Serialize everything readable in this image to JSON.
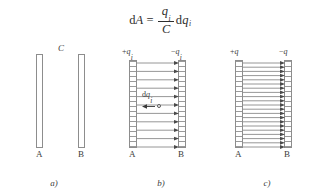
{
  "formula": {
    "lhs_d": "d",
    "lhs_var": "A",
    "equals": "=",
    "numerator_var": "q",
    "numerator_sub": "i",
    "denominator_var": "C",
    "rhs_d": "d",
    "rhs_var": "q",
    "rhs_sub": "i",
    "plain_text": "dA = (q_i / C) dq_i"
  },
  "colors": {
    "plate_border": "#8d8d8d",
    "field_line": "#7c7c7c",
    "arrow_head": "#4a4a4a",
    "text": "#3c3c3c",
    "background": "#ffffff"
  },
  "panels": [
    {
      "id": "a",
      "caption": "a)",
      "top_label": "C",
      "left_plate_label": "A",
      "right_plate_label": "B",
      "left_plate_charge": "",
      "right_plate_charge": "",
      "field_line_count": 0,
      "plates_hatched": false
    },
    {
      "id": "b",
      "caption": "b)",
      "top_label": "",
      "left_plate_label": "A",
      "right_plate_label": "B",
      "left_plate_charge_sign": "+",
      "left_plate_charge_var": "q",
      "left_plate_charge_sub": "i",
      "right_plate_charge_sign": "−",
      "right_plate_charge_var": "q",
      "right_plate_charge_sub": "i",
      "field_line_count": 11,
      "plates_hatched": true,
      "charge_element_d": "d",
      "charge_element_var": "q",
      "charge_element_sub": "i"
    },
    {
      "id": "c",
      "caption": "c)",
      "top_label": "",
      "left_plate_label": "A",
      "right_plate_label": "B",
      "left_plate_charge_sign": "+",
      "left_plate_charge_var": "q",
      "left_plate_charge_sub": "",
      "right_plate_charge_sign": "−",
      "right_plate_charge_var": "q",
      "right_plate_charge_sub": "",
      "field_line_count": 21,
      "plates_hatched": true
    }
  ]
}
